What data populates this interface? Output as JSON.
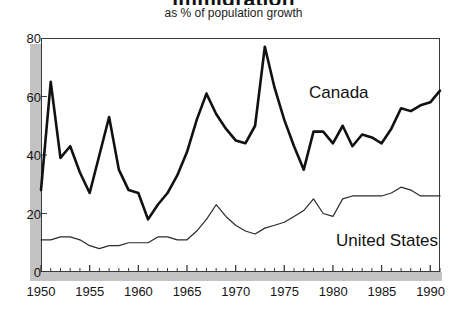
{
  "chart": {
    "title": "immigration",
    "subtitle": "as % of population growth"
  },
  "axes": {
    "y_ticks": [
      "0",
      "20",
      "40",
      "60",
      "80"
    ],
    "x_ticks": [
      "1950",
      "1955",
      "1960",
      "1965",
      "1970",
      "1975",
      "1980",
      "1985",
      "1990"
    ]
  },
  "labels": {
    "canada": "Canada",
    "united_states": "United States"
  },
  "colors": {
    "canada_line": "#111111",
    "us_line": "#2b2b2b",
    "axis": "#3a3a3a",
    "shadow": "#c3c3c3",
    "background": "#ffffff"
  },
  "chart_data": {
    "type": "line",
    "title": "immigration",
    "subtitle": "as % of population growth",
    "xlabel": "",
    "ylabel": "",
    "xlim": [
      1950,
      1991
    ],
    "ylim": [
      0,
      80
    ],
    "grid": false,
    "legend": "inline-annotation",
    "x": [
      1950,
      1951,
      1952,
      1953,
      1954,
      1955,
      1956,
      1957,
      1958,
      1959,
      1960,
      1961,
      1962,
      1963,
      1964,
      1965,
      1966,
      1967,
      1968,
      1969,
      1970,
      1971,
      1972,
      1973,
      1974,
      1975,
      1976,
      1977,
      1978,
      1979,
      1980,
      1981,
      1982,
      1983,
      1984,
      1985,
      1986,
      1987,
      1988,
      1989,
      1990,
      1991
    ],
    "series": [
      {
        "name": "Canada",
        "values": [
          28,
          65,
          39,
          43,
          34,
          27,
          40,
          53,
          35,
          28,
          27,
          18,
          23,
          27,
          33,
          41,
          52,
          61,
          54,
          49,
          45,
          44,
          50,
          77,
          63,
          52,
          43,
          35,
          48,
          48,
          44,
          50,
          43,
          47,
          46,
          44,
          49,
          56,
          55,
          57,
          58,
          62
        ]
      },
      {
        "name": "United States",
        "values": [
          11,
          11,
          12,
          12,
          11,
          9,
          8,
          9,
          9,
          10,
          10,
          10,
          12,
          12,
          11,
          11,
          14,
          18,
          23,
          19,
          16,
          14,
          13,
          15,
          16,
          17,
          19,
          21,
          25,
          20,
          19,
          25,
          26,
          26,
          26,
          26,
          27,
          29,
          28,
          26,
          26,
          26
        ]
      }
    ]
  }
}
